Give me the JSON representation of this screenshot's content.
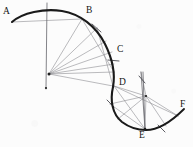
{
  "figure": {
    "width": 193,
    "height": 147,
    "background_color": "#fcfcfc",
    "ink_color": "#1a1a1a",
    "construction_color": "#8d8d92",
    "type": "geometric-construction-diagram"
  },
  "labels": {
    "a": "A",
    "b": "B",
    "c": "C",
    "d": "D",
    "e": "E",
    "f": "F"
  },
  "label_positions": {
    "a": {
      "x": 3,
      "y": 7
    },
    "b": {
      "x": 86,
      "y": 6
    },
    "c": {
      "x": 117,
      "y": 45
    },
    "d": {
      "x": 119,
      "y": 78
    },
    "e": {
      "x": 139,
      "y": 131
    },
    "f": {
      "x": 180,
      "y": 100
    }
  },
  "points": {
    "a": {
      "x": 12,
      "y": 22
    },
    "b": {
      "x": 82,
      "y": 19
    },
    "c": {
      "x": 113,
      "y": 52
    },
    "d": {
      "x": 114,
      "y": 86
    },
    "e": {
      "x": 145,
      "y": 129
    },
    "f": {
      "x": 184,
      "y": 109
    },
    "center_left": {
      "x": 49,
      "y": 74
    },
    "center_right": {
      "x": 146,
      "y": 96
    },
    "axis_top": {
      "x": 47,
      "y": 3
    },
    "axis_bottom": {
      "x": 46,
      "y": 89
    },
    "right_axis_top": {
      "x": 141,
      "y": 72
    },
    "right_axis_bottom": {
      "x": 145,
      "y": 130
    }
  },
  "curves": {
    "arc_ab_cd": "M 12 22 C 22 13, 44 8, 62 11 C 80 14, 96 26, 105 44 C 113 60, 115 76, 113 87",
    "arc_de": "M 113 87 C 110 100, 112 114, 122 122 C 130 128, 138 130, 146 130",
    "arc_ef": "M 146 130 C 158 130, 170 123, 184 109"
  },
  "construction_rays_left": [
    {
      "x1": 49,
      "y1": 74,
      "x2": 82,
      "y2": 19
    },
    {
      "x1": 49,
      "y1": 74,
      "x2": 97,
      "y2": 28
    },
    {
      "x1": 49,
      "y1": 74,
      "x2": 106,
      "y2": 41
    },
    {
      "x1": 49,
      "y1": 74,
      "x2": 112,
      "y2": 52
    },
    {
      "x1": 49,
      "y1": 74,
      "x2": 114,
      "y2": 64
    },
    {
      "x1": 49,
      "y1": 74,
      "x2": 114,
      "y2": 72
    },
    {
      "x1": 49,
      "y1": 74,
      "x2": 113,
      "y2": 86
    }
  ],
  "chords_left": [
    {
      "x1": 12,
      "y1": 22,
      "x2": 82,
      "y2": 19
    },
    {
      "x1": 82,
      "y1": 19,
      "x2": 114,
      "y2": 72
    },
    {
      "x1": 97,
      "y1": 28,
      "x2": 113,
      "y2": 86
    }
  ],
  "construction_rays_right": [
    {
      "x1": 146,
      "y1": 96,
      "x2": 114,
      "y2": 86
    },
    {
      "x1": 146,
      "y1": 96,
      "x2": 110,
      "y2": 104
    },
    {
      "x1": 146,
      "y1": 96,
      "x2": 118,
      "y2": 119
    },
    {
      "x1": 146,
      "y1": 96,
      "x2": 145,
      "y2": 129
    },
    {
      "x1": 146,
      "y1": 96,
      "x2": 166,
      "y2": 126
    },
    {
      "x1": 146,
      "y1": 96,
      "x2": 178,
      "y2": 116
    },
    {
      "x1": 146,
      "y1": 96,
      "x2": 141,
      "y2": 72
    }
  ],
  "chords_right": [
    {
      "x1": 114,
      "y1": 86,
      "x2": 178,
      "y2": 116
    },
    {
      "x1": 110,
      "y1": 104,
      "x2": 145,
      "y2": 129
    },
    {
      "x1": 114,
      "y1": 86,
      "x2": 145,
      "y2": 129
    },
    {
      "x1": 141,
      "y1": 72,
      "x2": 145,
      "y2": 129
    }
  ],
  "tick_marks": [
    {
      "x1": 92,
      "y1": 24,
      "x2": 101,
      "y2": 32
    },
    {
      "x1": 108,
      "y1": 60,
      "x2": 119,
      "y2": 61
    },
    {
      "x1": 107,
      "y1": 100,
      "x2": 114,
      "y2": 107
    },
    {
      "x1": 158,
      "y1": 125,
      "x2": 165,
      "y2": 132
    },
    {
      "x1": 139,
      "y1": 76,
      "x2": 145,
      "y2": 83
    }
  ]
}
